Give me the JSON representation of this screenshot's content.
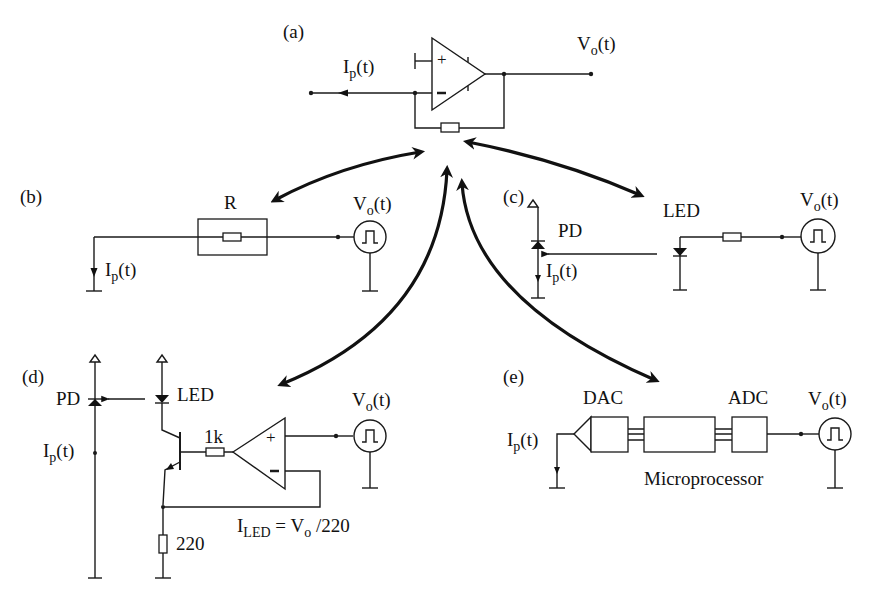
{
  "figure": {
    "background": "#ffffff",
    "ink_color": "#1a1a1a",
    "panels": {
      "a": {
        "label": "(a)",
        "current_label": "I",
        "current_sub": "p",
        "current_arg": "(t)",
        "voltage_label": "V",
        "voltage_sub": "o",
        "voltage_arg": "(t)",
        "opamp_plus": "+",
        "opamp_minus": "-"
      },
      "b": {
        "label": "(b)",
        "resistor_label": "R",
        "current_label": "I",
        "current_sub": "p",
        "current_arg": "(t)",
        "voltage_label": "V",
        "voltage_sub": "o",
        "voltage_arg": "(t)"
      },
      "c": {
        "label": "(c)",
        "pd_label": "PD",
        "led_label": "LED",
        "current_label": "I",
        "current_sub": "p",
        "current_arg": "(t)",
        "voltage_label": "V",
        "voltage_sub": "o",
        "voltage_arg": "(t)"
      },
      "d": {
        "label": "(d)",
        "pd_label": "PD",
        "led_label": "LED",
        "base_resistor": "1k",
        "emitter_resistor": "220",
        "current_label": "I",
        "current_sub": "p",
        "current_arg": "(t)",
        "voltage_label": "V",
        "voltage_sub": "o",
        "voltage_arg": "(t)",
        "opamp_plus": "+",
        "opamp_minus": "-",
        "equation_lhs": "I",
        "equation_lhs_sub": "LED",
        "equation_mid": " = V",
        "equation_mid_sub": "o",
        "equation_rhs": " /220"
      },
      "e": {
        "label": "(e)",
        "dac_label": "DAC",
        "adc_label": "ADC",
        "processor_label": "Microprocessor",
        "current_label": "I",
        "current_sub": "p",
        "current_arg": "(t)",
        "voltage_label": "V",
        "voltage_sub": "o",
        "voltage_arg": "(t)"
      }
    }
  }
}
